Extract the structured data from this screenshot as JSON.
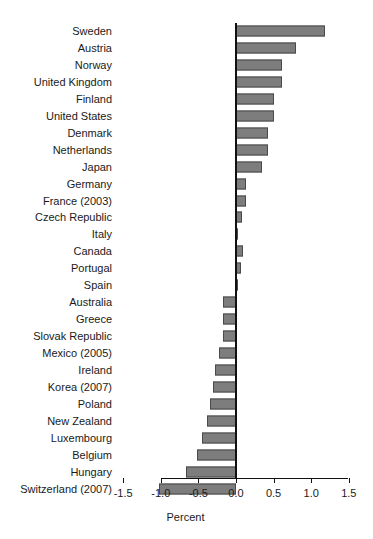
{
  "chart_data": {
    "type": "bar",
    "orientation": "horizontal",
    "title": "",
    "xlabel": "Percent",
    "ylabel": "",
    "xlim": [
      -1.5,
      1.5
    ],
    "xticks": [
      -1.5,
      -1.0,
      -0.5,
      0.0,
      0.5,
      1.0,
      1.5
    ],
    "xtick_labels": [
      "-1.5",
      "-1.0",
      "-0.5",
      "0.0",
      "0.5",
      "1.0",
      "1.5"
    ],
    "grid": false,
    "legend": null,
    "zero_reference_line": true,
    "bar_color": "#7d7d7d",
    "bar_edge_color": "#4a4a4a",
    "categories": [
      "Sweden",
      "Austria",
      "Norway",
      "United Kingdom",
      "Finland",
      "United States",
      "Denmark",
      "Netherlands",
      "Japan",
      "Germany",
      "France (2003)",
      "Czech Republic",
      "Italy",
      "Canada",
      "Portugal",
      "Spain",
      "Australia",
      "Greece",
      "Slovak Republic",
      "Mexico (2005)",
      "Ireland",
      "Korea (2007)",
      "Poland",
      "New Zealand",
      "Luxembourg",
      "Belgium",
      "Hungary",
      "Switzerland (2007)"
    ],
    "values": [
      1.19,
      0.8,
      0.61,
      0.61,
      0.5,
      0.5,
      0.43,
      0.43,
      0.34,
      0.13,
      0.13,
      0.08,
      0.03,
      0.09,
      0.06,
      0.01,
      -0.17,
      -0.17,
      -0.17,
      -0.22,
      -0.28,
      -0.31,
      -0.34,
      -0.38,
      -0.45,
      -0.52,
      -0.66,
      -1.02
    ]
  }
}
